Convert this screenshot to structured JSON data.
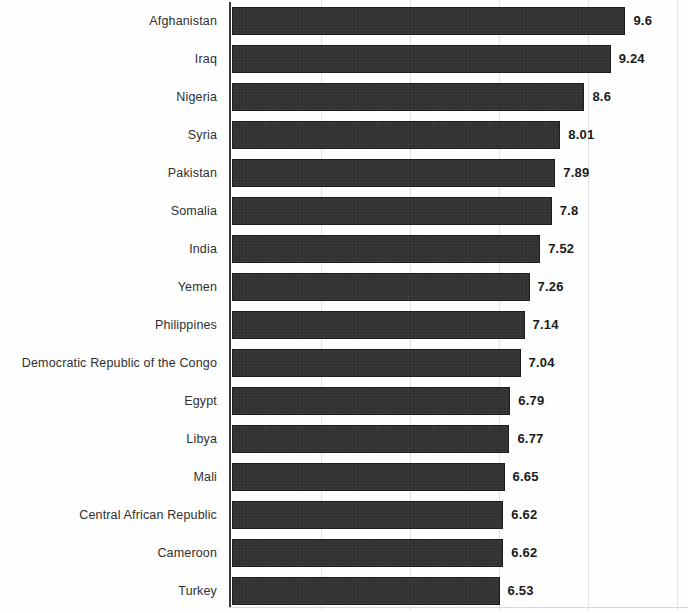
{
  "chart_data": {
    "type": "bar",
    "orientation": "horizontal",
    "title": "",
    "subtitle": "",
    "xlabel": "",
    "ylabel": "",
    "grid": true,
    "legend": false,
    "legend_position": "none",
    "xlim": [
      0,
      11.2
    ],
    "x_gridline_values": [
      2.24,
      4.42,
      6.6,
      8.76,
      10.94
    ],
    "bar_color": "#2b2b2b",
    "label_color": "#2f2f2f",
    "value_label_color": "#1a1a1a",
    "gridline_color": "#e2e2e4",
    "axis_color": "#3a3a3a",
    "categories": [
      "Afghanistan",
      "Iraq",
      "Nigeria",
      "Syria",
      "Pakistan",
      "Somalia",
      "India",
      "Yemen",
      "Philippines",
      "Democratic Republic of the Congo",
      "Egypt",
      "Libya",
      "Mali",
      "Central African Republic",
      "Cameroon",
      "Turkey"
    ],
    "values": [
      9.6,
      9.24,
      8.6,
      8.01,
      7.89,
      7.8,
      7.52,
      7.26,
      7.14,
      7.04,
      6.79,
      6.77,
      6.65,
      6.62,
      6.62,
      6.53
    ],
    "value_labels": [
      "9.6",
      "9.24",
      "8.6",
      "8.01",
      "7.89",
      "7.8",
      "7.52",
      "7.26",
      "7.14",
      "7.04",
      "6.79",
      "6.77",
      "6.65",
      "6.62",
      "6.62",
      "6.53"
    ]
  }
}
